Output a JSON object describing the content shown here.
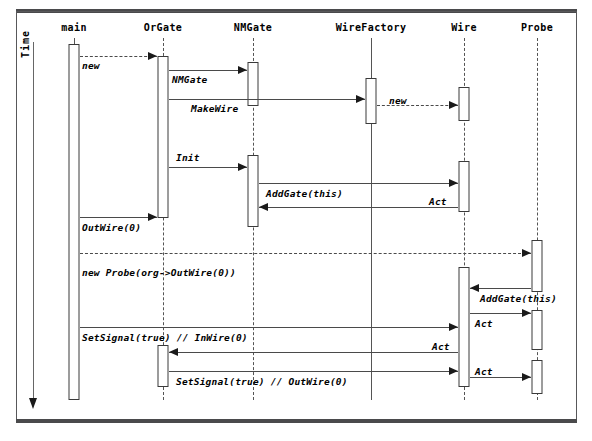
{
  "diagram": {
    "time_axis_label": "Time",
    "participants": [
      {
        "id": "main",
        "label": "main",
        "x": 74,
        "lifeline_style": "solid"
      },
      {
        "id": "orgate",
        "label": "OrGate",
        "x": 163,
        "lifeline_style": "dashed"
      },
      {
        "id": "nmgate",
        "label": "NMGate",
        "x": 253,
        "lifeline_style": "dashed"
      },
      {
        "id": "wirefactory",
        "label": "WireFactory",
        "x": 371,
        "lifeline_style": "solid"
      },
      {
        "id": "wire",
        "label": "Wire",
        "x": 464,
        "lifeline_style": "dashed"
      },
      {
        "id": "probe",
        "label": "Probe",
        "x": 537,
        "lifeline_style": "dashed"
      }
    ],
    "activations": [
      {
        "id": "act-main",
        "participant": "main",
        "x": 74,
        "y": 44,
        "w": 11,
        "h": 356
      },
      {
        "id": "act-orgate-1",
        "participant": "orgate",
        "x": 163,
        "y": 56,
        "w": 11,
        "h": 162
      },
      {
        "id": "act-orgate-2",
        "participant": "orgate",
        "x": 163,
        "y": 345,
        "w": 11,
        "h": 42
      },
      {
        "id": "act-nmgate-1",
        "participant": "nmgate",
        "x": 253,
        "y": 62,
        "w": 11,
        "h": 44
      },
      {
        "id": "act-nmgate-2",
        "participant": "nmgate",
        "x": 253,
        "y": 155,
        "w": 11,
        "h": 72
      },
      {
        "id": "act-wirefactory-1",
        "participant": "wirefactory",
        "x": 371,
        "y": 78,
        "w": 11,
        "h": 46
      },
      {
        "id": "act-wire-1",
        "participant": "wire",
        "x": 464,
        "y": 87,
        "w": 11,
        "h": 34
      },
      {
        "id": "act-wire-2",
        "participant": "wire",
        "x": 464,
        "y": 161,
        "w": 11,
        "h": 51
      },
      {
        "id": "act-wire-3",
        "participant": "wire",
        "x": 464,
        "y": 267,
        "w": 11,
        "h": 120
      },
      {
        "id": "act-probe-1",
        "participant": "probe",
        "x": 537,
        "y": 240,
        "w": 11,
        "h": 52
      },
      {
        "id": "act-probe-2",
        "participant": "probe",
        "x": 537,
        "y": 310,
        "w": 11,
        "h": 40
      },
      {
        "id": "act-probe-3",
        "participant": "probe",
        "x": 537,
        "y": 360,
        "w": 11,
        "h": 34
      }
    ],
    "messages": [
      {
        "id": "m1",
        "label": "new",
        "from": "main",
        "to": "orgate",
        "x1": 80,
        "x2": 157,
        "y": 56,
        "style": "dashed",
        "dir": "right",
        "label_x": 82,
        "label_y": 60,
        "italic": true
      },
      {
        "id": "m2",
        "label": "NMGate",
        "from": "orgate",
        "to": "nmgate",
        "x1": 169,
        "x2": 247,
        "y": 70,
        "style": "solid",
        "dir": "right",
        "label_x": 172,
        "label_y": 74,
        "italic": true
      },
      {
        "id": "m3",
        "label": "MakeWire",
        "from": "orgate",
        "to": "wirefactory",
        "x1": 169,
        "x2": 365,
        "y": 99,
        "style": "solid",
        "dir": "right",
        "label_x": 191,
        "label_y": 103,
        "italic": true
      },
      {
        "id": "m4",
        "label": "new",
        "from": "wirefactory",
        "to": "wire",
        "x1": 377,
        "x2": 458,
        "y": 105,
        "style": "dashed",
        "dir": "right",
        "label_x": 389,
        "label_y": 95,
        "italic": true
      },
      {
        "id": "m5",
        "label": "Init",
        "from": "orgate",
        "to": "nmgate",
        "x1": 169,
        "x2": 247,
        "y": 167,
        "style": "solid",
        "dir": "right",
        "label_x": 176,
        "label_y": 152,
        "italic": true
      },
      {
        "id": "m6",
        "label": "AddGate(this)",
        "from": "nmgate",
        "to": "wire",
        "x1": 259,
        "x2": 458,
        "y": 183,
        "style": "solid",
        "dir": "right",
        "label_x": 266,
        "label_y": 188,
        "italic": true
      },
      {
        "id": "m7",
        "label": "Act",
        "from": "wire",
        "to": "nmgate",
        "x1": 259,
        "x2": 458,
        "y": 207,
        "style": "solid",
        "dir": "left",
        "label_x": 429,
        "label_y": 196,
        "italic": true
      },
      {
        "id": "m8",
        "label": "OutWire(0)",
        "from": "main",
        "to": "orgate",
        "x1": 80,
        "x2": 157,
        "y": 217,
        "style": "solid",
        "dir": "right",
        "label_x": 82,
        "label_y": 222,
        "italic": true
      },
      {
        "id": "m9",
        "label": "",
        "from": "main",
        "to": "probe",
        "x1": 80,
        "x2": 531,
        "y": 253,
        "style": "dashed",
        "dir": "right",
        "label_x": 0,
        "label_y": 0,
        "italic": true
      },
      {
        "id": "m10",
        "label": "new Probe(org->OutWire(0))",
        "from": "main",
        "to": "probe",
        "x1": 80,
        "x2": 531,
        "y": 270,
        "style": "none",
        "dir": "none",
        "label_x": 82,
        "label_y": 267,
        "italic": true
      },
      {
        "id": "m11",
        "label": "AddGate(this)",
        "from": "probe",
        "to": "wire",
        "x1": 470,
        "x2": 531,
        "y": 288,
        "style": "solid",
        "dir": "left",
        "label_x": 480,
        "label_y": 293,
        "italic": true
      },
      {
        "id": "m12",
        "label": "Act",
        "from": "wire",
        "to": "probe",
        "x1": 470,
        "x2": 531,
        "y": 313,
        "style": "solid",
        "dir": "right",
        "label_x": 475,
        "label_y": 318,
        "italic": true
      },
      {
        "id": "m13",
        "label": "SetSignal(true)  // InWire(0)",
        "from": "main",
        "to": "wire",
        "x1": 80,
        "x2": 458,
        "y": 327,
        "style": "solid",
        "dir": "right",
        "label_x": 82,
        "label_y": 332,
        "italic": true
      },
      {
        "id": "m14",
        "label": "Act",
        "from": "wire",
        "to": "orgate",
        "x1": 169,
        "x2": 458,
        "y": 352,
        "style": "solid",
        "dir": "left",
        "label_x": 432,
        "label_y": 341,
        "italic": true
      },
      {
        "id": "m15",
        "label": "SetSignal(true)        // OutWire(0)",
        "from": "orgate",
        "to": "wire",
        "x1": 169,
        "x2": 458,
        "y": 371,
        "style": "solid",
        "dir": "right",
        "label_x": 176,
        "label_y": 376,
        "italic": true
      },
      {
        "id": "m16",
        "label": "Act",
        "from": "wire",
        "to": "probe",
        "x1": 470,
        "x2": 531,
        "y": 377,
        "style": "solid",
        "dir": "right",
        "label_x": 475,
        "label_y": 366,
        "italic": true
      }
    ]
  },
  "colors": {
    "line": "#4a4a4a",
    "frame": "#4a4a4c",
    "text": "#000000",
    "background": "#ffffff"
  }
}
